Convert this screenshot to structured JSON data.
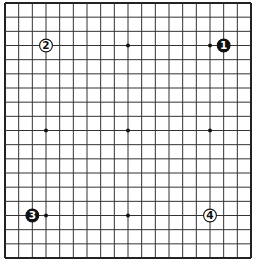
{
  "board": {
    "size": 19,
    "left": 5,
    "top": 3,
    "right": 251,
    "bottom": 258,
    "line_color": "#333333",
    "edge_color": "#222222",
    "background": "#ffffff",
    "star_points": [
      [
        3,
        3
      ],
      [
        9,
        3
      ],
      [
        15,
        3
      ],
      [
        3,
        9
      ],
      [
        9,
        9
      ],
      [
        15,
        9
      ],
      [
        3,
        15
      ],
      [
        9,
        15
      ],
      [
        15,
        15
      ]
    ]
  },
  "stones": [
    {
      "move": "1",
      "color": "black",
      "col": 16,
      "row": 3
    },
    {
      "move": "2",
      "color": "white",
      "col": 3,
      "row": 3
    },
    {
      "move": "3",
      "color": "black",
      "col": 2,
      "row": 15
    },
    {
      "move": "4",
      "color": "white",
      "col": 15,
      "row": 15
    }
  ]
}
